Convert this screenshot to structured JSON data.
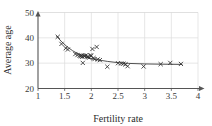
{
  "chart_data": {
    "type": "scatter",
    "title": "",
    "xlabel": "Fertility rate",
    "ylabel": "Average age",
    "xlim": [
      1,
      4
    ],
    "ylim": [
      20,
      50
    ],
    "xticks": [
      1,
      1.5,
      2,
      2.5,
      3,
      3.5,
      4
    ],
    "xticklabels": [
      "1",
      "1.5",
      "2",
      "2.5",
      "3",
      "3.5",
      "4"
    ],
    "yticks": [
      20,
      30,
      40,
      50
    ],
    "yticklabels": [
      "20",
      "30",
      "40",
      "50"
    ],
    "grid": true,
    "legend": null,
    "marker": "x",
    "points": [
      {
        "x": 1.37,
        "y": 40.4
      },
      {
        "x": 1.44,
        "y": 37.6
      },
      {
        "x": 1.52,
        "y": 35.9
      },
      {
        "x": 1.56,
        "y": 35.4
      },
      {
        "x": 1.7,
        "y": 33.6
      },
      {
        "x": 1.74,
        "y": 33.2
      },
      {
        "x": 1.78,
        "y": 32.9
      },
      {
        "x": 1.8,
        "y": 32.8
      },
      {
        "x": 1.82,
        "y": 33.0
      },
      {
        "x": 1.83,
        "y": 32.5
      },
      {
        "x": 1.84,
        "y": 30.1
      },
      {
        "x": 1.86,
        "y": 32.9
      },
      {
        "x": 1.88,
        "y": 32.8
      },
      {
        "x": 1.9,
        "y": 33.1
      },
      {
        "x": 1.92,
        "y": 32.6
      },
      {
        "x": 1.94,
        "y": 32.4
      },
      {
        "x": 1.96,
        "y": 32.2
      },
      {
        "x": 1.98,
        "y": 33.1
      },
      {
        "x": 2.0,
        "y": 32.9
      },
      {
        "x": 2.02,
        "y": 35.6
      },
      {
        "x": 2.04,
        "y": 32.0
      },
      {
        "x": 2.06,
        "y": 31.6
      },
      {
        "x": 2.1,
        "y": 36.4
      },
      {
        "x": 2.12,
        "y": 31.5
      },
      {
        "x": 2.16,
        "y": 31.2
      },
      {
        "x": 2.3,
        "y": 28.6
      },
      {
        "x": 2.5,
        "y": 30.0
      },
      {
        "x": 2.56,
        "y": 29.9
      },
      {
        "x": 2.6,
        "y": 29.8
      },
      {
        "x": 2.64,
        "y": 29.5
      },
      {
        "x": 2.68,
        "y": 28.8
      },
      {
        "x": 2.98,
        "y": 28.7
      },
      {
        "x": 3.3,
        "y": 29.6
      },
      {
        "x": 3.48,
        "y": 30.1
      },
      {
        "x": 3.68,
        "y": 29.7
      }
    ],
    "fit_curve": [
      {
        "x": 1.35,
        "y": 40.6
      },
      {
        "x": 1.45,
        "y": 38.3
      },
      {
        "x": 1.55,
        "y": 36.4
      },
      {
        "x": 1.65,
        "y": 34.9
      },
      {
        "x": 1.75,
        "y": 33.7
      },
      {
        "x": 1.85,
        "y": 32.8
      },
      {
        "x": 1.95,
        "y": 32.1
      },
      {
        "x": 2.05,
        "y": 31.6
      },
      {
        "x": 2.15,
        "y": 31.2
      },
      {
        "x": 2.3,
        "y": 30.7
      },
      {
        "x": 2.5,
        "y": 30.2
      },
      {
        "x": 2.7,
        "y": 29.9
      },
      {
        "x": 3.0,
        "y": 29.7
      },
      {
        "x": 3.3,
        "y": 29.6
      },
      {
        "x": 3.7,
        "y": 29.5
      }
    ]
  }
}
